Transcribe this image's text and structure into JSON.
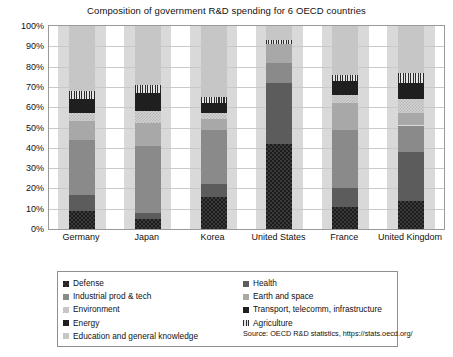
{
  "chart_data": {
    "type": "bar",
    "subtype": "stacked-bar-100-percent",
    "title": "Composition of government R&D spending for 6 OECD countries",
    "xlabel": "",
    "ylabel": "",
    "ylim": [
      0,
      100
    ],
    "ytick_labels": [
      "0%",
      "10%",
      "20%",
      "30%",
      "40%",
      "50%",
      "60%",
      "70%",
      "80%",
      "90%",
      "100%"
    ],
    "ytick_values": [
      0,
      10,
      20,
      30,
      40,
      50,
      60,
      70,
      80,
      90,
      100
    ],
    "grid": true,
    "legend_position": "bottom",
    "categories": [
      "Germany",
      "Japan",
      "Korea",
      "United States",
      "France",
      "United Kingdom"
    ],
    "series": [
      {
        "name": "Defense",
        "key": "defense",
        "color": "#1c1c1c",
        "pattern": "checker",
        "values": [
          9,
          5,
          16,
          42,
          11,
          14
        ]
      },
      {
        "name": "Health",
        "key": "health",
        "color": "#5c5c5c",
        "pattern": "solid",
        "values": [
          8,
          3,
          6,
          30,
          9,
          24
        ]
      },
      {
        "name": "Industrial prod & tech",
        "key": "industrial",
        "color": "#8a8a8a",
        "pattern": "solid",
        "values": [
          27,
          33,
          27,
          10,
          29,
          13
        ]
      },
      {
        "name": "Earth and space",
        "key": "earth",
        "color": "#a8a8a8",
        "pattern": "solid",
        "values": [
          9,
          11,
          5,
          9,
          13,
          6
        ]
      },
      {
        "name": "Environment",
        "key": "environment",
        "color": "#d2d2d2",
        "pattern": "dotted",
        "values": [
          4,
          6,
          3,
          0,
          4,
          7
        ]
      },
      {
        "name": "Transport, telecomm, infrastructure",
        "key": "transport",
        "color": "#1f1f1f",
        "pattern": "solid",
        "values": [
          7,
          9,
          5,
          0,
          7,
          8
        ]
      },
      {
        "name": "Agriculture",
        "key": "agriculture",
        "color": "#d8d8d8",
        "pattern": "vstripe",
        "values": [
          4,
          4,
          3,
          2,
          3,
          5
        ]
      },
      {
        "name": "Education and general knowledge",
        "key": "education",
        "color": "#c6c6c6",
        "pattern": "solid",
        "values": [
          32,
          29,
          35,
          7,
          24,
          23
        ]
      }
    ],
    "source": "Source: OECD R&D statistics, https://stats.oecd.org/"
  },
  "legend": {
    "left_items": [
      {
        "label": "Defense",
        "key": "defense"
      },
      {
        "label": "Industrial prod & tech",
        "key": "industrial"
      },
      {
        "label": "Environment",
        "key": "environment"
      },
      {
        "label": "Energy",
        "key": "transport"
      },
      {
        "label": "Education and general knowledge",
        "key": "education"
      }
    ],
    "right_items": [
      {
        "label": "Health",
        "key": "health"
      },
      {
        "label": "Earth and space",
        "key": "earth"
      },
      {
        "label": "Transport, telecomm, infrastructure",
        "key": "transport"
      },
      {
        "label": "Agriculture",
        "key": "agriculture"
      }
    ],
    "source": "Source: OECD R&D statistics, https://stats.oecd.org/"
  }
}
